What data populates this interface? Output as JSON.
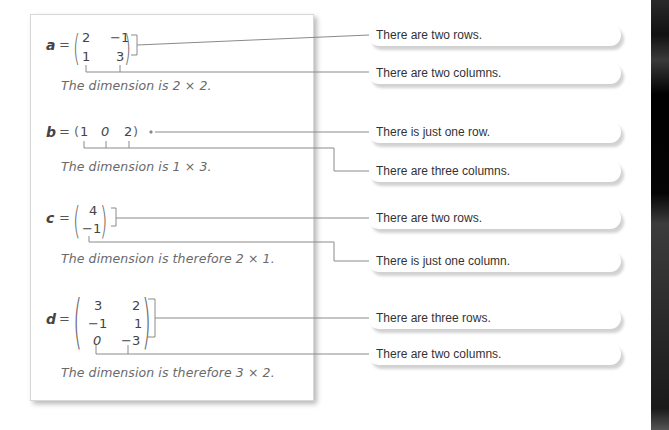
{
  "matrices": [
    {
      "name": "a",
      "rows": [
        [
          "2",
          "−1"
        ],
        [
          "1",
          "3"
        ]
      ],
      "dimension_text": "The dimension is 2 × 2.",
      "callouts": [
        "There are two rows.",
        "There are two columns."
      ]
    },
    {
      "name": "b",
      "rows": [
        [
          "1",
          "0",
          "2"
        ]
      ],
      "dimension_text": "The dimension is 1 × 3.",
      "callouts": [
        "There is just one row.",
        "There are three columns."
      ]
    },
    {
      "name": "c",
      "rows": [
        [
          "4"
        ],
        [
          "−1"
        ]
      ],
      "dimension_text": "The dimension is therefore 2 × 1.",
      "callouts": [
        "There are two rows.",
        "There is just one column."
      ]
    },
    {
      "name": "d",
      "rows": [
        [
          "3",
          "2"
        ],
        [
          "−1",
          "1"
        ],
        [
          "0",
          "−3"
        ]
      ],
      "dimension_text": "The dimension is therefore 3 × 2.",
      "callouts": [
        "There are three rows.",
        "There are two columns."
      ]
    }
  ],
  "symbols": {
    "equals": "="
  },
  "colors": {
    "line": "#8a8a8a",
    "text": "#333333",
    "panel_border": "#d8d8d8"
  }
}
